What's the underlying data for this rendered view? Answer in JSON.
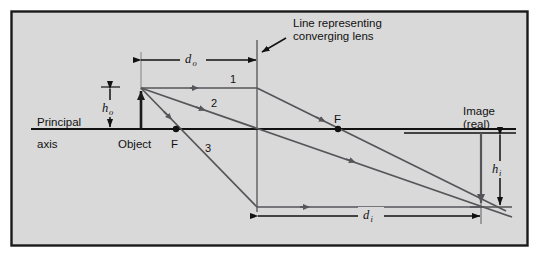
{
  "figure": {
    "kind": "ray-diagram",
    "title_text": "",
    "panel": {
      "background_color": "#d9d9d9",
      "border_color": "#1a1a1a",
      "x": 11,
      "y": 11,
      "width": 517,
      "height": 235
    },
    "colors": {
      "ray_color": "#55555a",
      "object_color": "#1a1a1a",
      "axis_color": "#111111",
      "dimension_color": "#111111",
      "lens_color": "#6b6b70",
      "construction_color": "#8a8a90",
      "text_color": "#111111"
    },
    "labels": {
      "principal": "Principal",
      "axis": "axis",
      "object": "Object",
      "focal_left": "F",
      "focal_right": "F",
      "image_line1": "Image",
      "image_line2": "(real)",
      "callout_line1": "Line representing",
      "callout_line2": "converging lens",
      "ray1": "1",
      "ray2": "2",
      "ray3": "3",
      "d_o": "d",
      "d_o_sub": "o",
      "d_i": "d",
      "d_i_sub": "i",
      "h_o": "h",
      "h_o_sub": "o",
      "h_i": "h",
      "h_i_sub": "i"
    },
    "geometry": {
      "axis_y": 129,
      "lens_x": 257,
      "lens_top_y": 40,
      "lens_bottom_y": 212,
      "object_x": 141,
      "object_tip_y": 88,
      "focal_left_x": 176,
      "focal_right_x": 338,
      "image_x": 481,
      "image_bottom_y": 206,
      "do_dim_y": 60,
      "di_dim_y": 216,
      "ho_dim_x": 110,
      "hi_dim_x": 500,
      "ray3_lens_y": 207
    }
  }
}
